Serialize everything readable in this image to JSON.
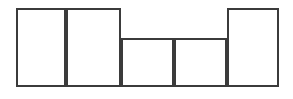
{
  "figure": {
    "title": "",
    "caption": "",
    "background_color": "#ffffff",
    "stroke_color": "#3b3b3b",
    "stroke_width": 2,
    "fill_color": "#ffffff",
    "canvas": {
      "width": 293,
      "height": 99
    }
  },
  "chart_data": {
    "type": "bar",
    "title": "",
    "subtitle": "",
    "xlabel": "",
    "ylabel": "",
    "grid": false,
    "legend": null,
    "axis_visible": false,
    "baseline_y": 87,
    "top_tall_y": 8,
    "top_short_y": 38,
    "xlim": [
      16,
      279
    ],
    "ylim": [
      0,
      79
    ],
    "categories": [
      "1",
      "2",
      "3",
      "4",
      "5"
    ],
    "values": [
      79,
      79,
      49,
      49,
      79
    ],
    "bar_edges_x": [
      16,
      66,
      121,
      174,
      227,
      279
    ],
    "bars": [
      {
        "index": 1,
        "label": "1",
        "x_left": 16,
        "x_right": 66,
        "y_top": 8,
        "y_bottom": 87,
        "width": 50,
        "height": 79,
        "height_class": "tall"
      },
      {
        "index": 2,
        "label": "2",
        "x_left": 66,
        "x_right": 121,
        "y_top": 8,
        "y_bottom": 87,
        "width": 55,
        "height": 79,
        "height_class": "tall"
      },
      {
        "index": 3,
        "label": "3",
        "x_left": 121,
        "x_right": 174,
        "y_top": 38,
        "y_bottom": 87,
        "width": 53,
        "height": 49,
        "height_class": "short"
      },
      {
        "index": 4,
        "label": "4",
        "x_left": 174,
        "x_right": 227,
        "y_top": 38,
        "y_bottom": 87,
        "width": 53,
        "height": 49,
        "height_class": "short"
      },
      {
        "index": 5,
        "label": "5",
        "x_left": 227,
        "x_right": 279,
        "y_top": 8,
        "y_bottom": 87,
        "width": 52,
        "height": 79,
        "height_class": "tall"
      }
    ],
    "annotations": []
  }
}
